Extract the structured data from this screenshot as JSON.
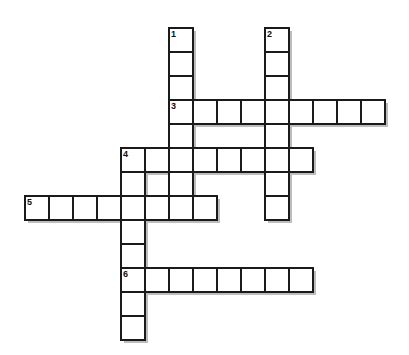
{
  "puzzle": {
    "cell_size": 24,
    "origin_x": 25,
    "origin_y": 28,
    "colors": {
      "border": "#1a1a1a",
      "cell": "#ffffff",
      "shadow": "#bdbdbd",
      "background": "#ffffff"
    },
    "entries": [
      {
        "number": "1",
        "direction": "down",
        "col": 6,
        "row": 0,
        "length": 8
      },
      {
        "number": "2",
        "direction": "down",
        "col": 10,
        "row": 0,
        "length": 8
      },
      {
        "number": "3",
        "direction": "across",
        "col": 6,
        "row": 3,
        "length": 9
      },
      {
        "number": "4",
        "direction": "across",
        "col": 4,
        "row": 5,
        "length": 8
      },
      {
        "number": "4",
        "direction": "down",
        "col": 4,
        "row": 5,
        "length": 8
      },
      {
        "number": "5",
        "direction": "across",
        "col": 0,
        "row": 7,
        "length": 8
      },
      {
        "number": "6",
        "direction": "across",
        "col": 4,
        "row": 10,
        "length": 8
      }
    ]
  }
}
